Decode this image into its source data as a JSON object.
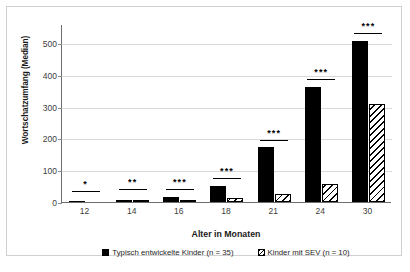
{
  "chart_data": {
    "type": "bar",
    "title": "",
    "xlabel": "Alter in Monaten",
    "ylabel": "Wortschatzumfang (Median)",
    "categories": [
      "12",
      "14",
      "16",
      "18",
      "21",
      "24",
      "30"
    ],
    "ylim": [
      0,
      560
    ],
    "yticks": [
      0,
      100,
      200,
      300,
      400,
      500
    ],
    "ytick_labels": [
      "0",
      "100",
      "200",
      "300",
      "400",
      "500"
    ],
    "grid": "horizontal",
    "legend_position": "bottom-center",
    "series": [
      {
        "name": "Typisch entwickelte Kinder (n = 35)",
        "style": "solid-black",
        "color": "#000000",
        "values": [
          2,
          5,
          15,
          50,
          172,
          362,
          507
        ]
      },
      {
        "name": "Kinder mit SEV (n = 10)",
        "style": "diagonal-hatch",
        "color": "#000000",
        "values": [
          0,
          3,
          5,
          14,
          24,
          57,
          308
        ]
      }
    ],
    "annotations": {
      "kind": "significance-brackets",
      "marks": [
        "*",
        "**",
        "***",
        "***",
        "***",
        "***",
        "***"
      ],
      "bracket_levels": [
        36,
        40,
        41,
        75,
        196,
        387,
        533
      ]
    }
  },
  "axis": {
    "y_title": "Wortschatzumfang (Median)",
    "x_title": "Alter in Monaten"
  },
  "legend": {
    "items": [
      {
        "label": "Typisch entwickelte Kinder (n = 35)",
        "swatch": "solid"
      },
      {
        "label": "Kinder mit SEV (n = 10)",
        "swatch": "hatch"
      }
    ]
  }
}
